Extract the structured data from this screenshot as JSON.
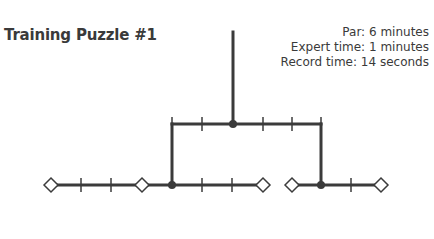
{
  "header": {
    "title": "Training Puzzle #1"
  },
  "stats": {
    "par": "Par: 6 minutes",
    "expert_time": "Expert time: 1 minutes",
    "record_time": "Record time: 14 seconds"
  },
  "colors": {
    "line": "#3b3b3b",
    "text": "#3a3a3a",
    "background": "#ffffff"
  },
  "puzzle": {
    "root_line": {
      "x": 233,
      "y1": 32,
      "y2": 124
    },
    "middle_bar": {
      "y": 124,
      "x1": 172,
      "x2": 321,
      "ticks": [
        202,
        263,
        292
      ],
      "node": 233
    },
    "left_drop": {
      "x": 172,
      "y1": 124,
      "y2": 185
    },
    "right_drop": {
      "x": 321,
      "y1": 124,
      "y2": 185
    },
    "bottom_left": {
      "y": 185,
      "x1": 51,
      "x2": 263,
      "diamonds": [
        51,
        142,
        263
      ],
      "ticks": [
        81,
        111,
        202,
        232
      ],
      "node": 172
    },
    "bottom_right": {
      "y": 185,
      "x1": 292,
      "x2": 381,
      "diamonds": [
        292,
        381
      ],
      "ticks": [
        351
      ],
      "node": 321
    }
  }
}
